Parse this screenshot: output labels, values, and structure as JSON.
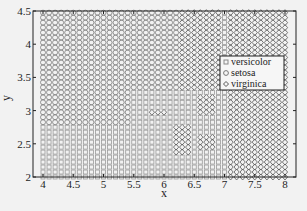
{
  "chart_data": {
    "type": "scatter",
    "title": "",
    "xlabel": "x",
    "ylabel": "y",
    "xlim": [
      3.85,
      8.2
    ],
    "ylim": [
      2,
      4.5
    ],
    "xticks": [
      4,
      4.5,
      5,
      5.5,
      6,
      6.5,
      7,
      7.5,
      8
    ],
    "xtick_labels": [
      "4",
      "4.5",
      "5",
      "5.5",
      "6",
      "6.5",
      "7",
      "7.5",
      "8"
    ],
    "yticks": [
      2,
      2.5,
      3,
      3.5,
      4,
      4.5
    ],
    "ytick_labels": [
      "2",
      "2.5",
      "3",
      "3.5",
      "4",
      "4.5"
    ],
    "grid": false,
    "legend_position": "right-center",
    "grid_step": {
      "x": 0.1,
      "y": 0.075
    },
    "grid_range": {
      "x": [
        4.0,
        8.0
      ],
      "y": [
        2.0,
        4.5
      ]
    },
    "series": [
      {
        "name": "versicolor",
        "marker": "square"
      },
      {
        "name": "setosa",
        "marker": "circle"
      },
      {
        "name": "virginica",
        "marker": "diamond"
      }
    ],
    "regions": {
      "virginica": [
        {
          "x": [
            7.05,
            8.05
          ],
          "y": [
            2.0,
            4.55
          ]
        },
        {
          "x": [
            6.25,
            6.95
          ],
          "y": [
            3.32,
            4.55
          ]
        },
        {
          "x": [
            5.75,
            6.05
          ],
          "y": [
            2.96,
            3.04
          ]
        },
        {
          "x": [
            6.15,
            6.45
          ],
          "y": [
            2.35,
            2.78
          ]
        },
        {
          "x": [
            6.55,
            6.85
          ],
          "y": [
            2.38,
            2.62
          ]
        },
        {
          "x": [
            6.55,
            6.85
          ],
          "y": [
            2.96,
            3.2
          ]
        }
      ],
      "versicolor": [
        {
          "x": [
            5.45,
            7.05
          ],
          "y": [
            2.0,
            3.32
          ]
        },
        {
          "x": [
            3.95,
            5.45
          ],
          "y": [
            2.0,
            2.78
          ]
        },
        {
          "x": [
            6.95,
            7.05
          ],
          "y": [
            3.3,
            4.55
          ]
        }
      ],
      "default": "setosa"
    }
  },
  "legend": {
    "items": [
      {
        "label": "versicolor",
        "marker": "square"
      },
      {
        "label": "setosa",
        "marker": "circle"
      },
      {
        "label": "virginica",
        "marker": "diamond"
      }
    ]
  },
  "colors": {
    "versicolor": "#9a9a9a",
    "setosa": "#7a7a7a",
    "virginica": "#555555",
    "axis": "#222222"
  }
}
